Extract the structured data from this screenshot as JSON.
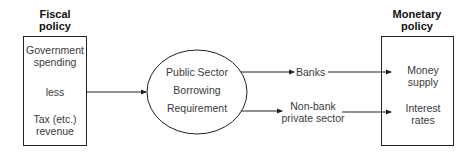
{
  "fiscal": {
    "heading_line1": "Fiscal",
    "heading_line2": "policy",
    "item1_line1": "Government",
    "item1_line2": "spending",
    "connector": "less",
    "item2_line1": "Tax (etc.)",
    "item2_line2": "revenue"
  },
  "psbr": {
    "line1": "Public Sector",
    "line2": "Borrowing",
    "line3": "Requirement"
  },
  "channels": {
    "banks": "Banks",
    "nonbank_line1": "Non-bank",
    "nonbank_line2": "private sector"
  },
  "monetary": {
    "heading_line1": "Monetary",
    "heading_line2": "policy",
    "item1_line1": "Money",
    "item1_line2": "supply",
    "item2_line1": "Interest",
    "item2_line2": "rates"
  }
}
